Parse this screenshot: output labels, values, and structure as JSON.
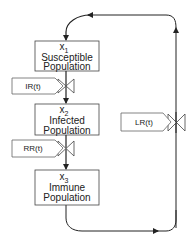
{
  "diagram": {
    "compartments": [
      {
        "id": "x1",
        "var": "x",
        "sub": "1",
        "line1": "Susceptible",
        "line2": "Population"
      },
      {
        "id": "x2",
        "var": "x",
        "sub": "2",
        "line1": "Infected",
        "line2": "Population"
      },
      {
        "id": "x3",
        "var": "x",
        "sub": "3",
        "line1": "Immune",
        "line2": "Population"
      }
    ],
    "rates": [
      {
        "id": "ir",
        "label": "IR(t)",
        "from": "x1",
        "to": "x2"
      },
      {
        "id": "rr",
        "label": "RR(t)",
        "from": "x2",
        "to": "x3"
      },
      {
        "id": "lr",
        "label": "LR(t)",
        "from": "x3",
        "to": "x1"
      }
    ],
    "colors": {
      "line": "#222222",
      "box_fill": "#ffffff",
      "background": "#ffffff"
    }
  }
}
